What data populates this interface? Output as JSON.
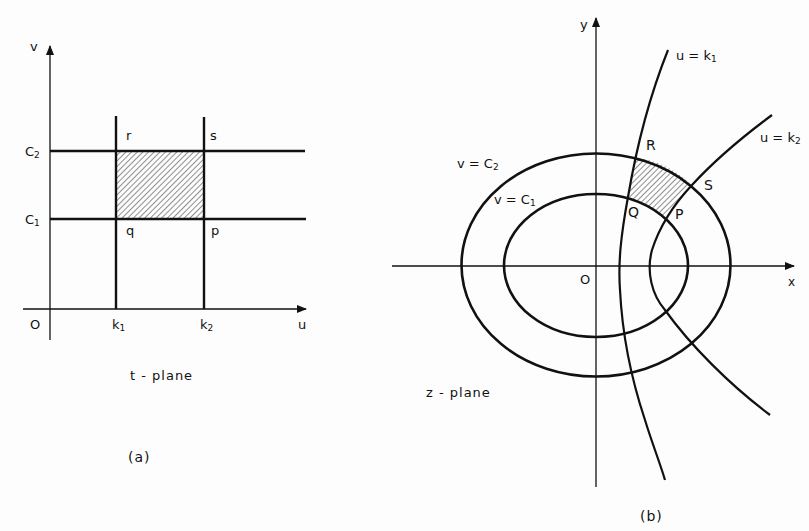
{
  "figure": {
    "panel_a": {
      "caption": "(a)",
      "plane_label": "t - plane",
      "axis_labels": {
        "vertical": "v",
        "horizontal": "u",
        "origin": "O"
      },
      "tick_labels": {
        "c1": "C",
        "c1_sub": "1",
        "c2": "C",
        "c2_sub": "2",
        "k1": "k",
        "k1_sub": "1",
        "k2": "k",
        "k2_sub": "2"
      },
      "corner_labels": {
        "r": "r",
        "s": "s",
        "q": "q",
        "p": "p"
      },
      "shaded_region": "rectangle pqrs bounded by u=k1, u=k2, v=C1, v=C2"
    },
    "panel_b": {
      "caption": "(b)",
      "plane_label": "z - plane",
      "axis_labels": {
        "vertical": "y",
        "horizontal": "x",
        "origin": "O"
      },
      "curve_labels": {
        "v_c2": "v = C",
        "v_c2_sub": "2",
        "v_c1": "v = C",
        "v_c1_sub": "1",
        "u_k1": "u = k",
        "u_k1_sub": "1",
        "u_k2": "u = k",
        "u_k2_sub": "2"
      },
      "corner_labels": {
        "R": "R",
        "S": "S",
        "Q": "Q",
        "P": "P"
      },
      "shaded_region": "curvilinear quadrilateral PQRS bounded by u=k1, u=k2, v=C1, v=C2"
    },
    "colors": {
      "ink": "#111111",
      "background": "#fdfdfd"
    }
  }
}
